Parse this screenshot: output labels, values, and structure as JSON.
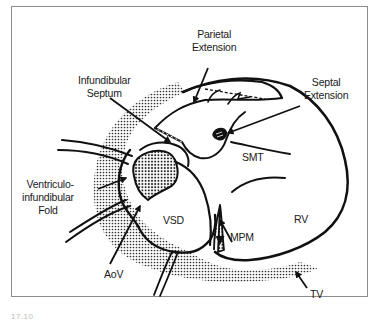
{
  "figure": {
    "caption": "17.10",
    "colors": {
      "line": "#111111",
      "stipple": "#333333",
      "frame": "#8c8c8c",
      "background": "#ffffff"
    }
  },
  "labels": {
    "parietal_extension": [
      "Parietal",
      "Extension"
    ],
    "infundibular_septum": [
      "Infundibular",
      "Septum"
    ],
    "septal_extension": [
      "Septal",
      "Extension"
    ],
    "smt": "SMT",
    "ventriculo_infundibular_fold": [
      "Ventriculo-",
      "infundibular",
      "Fold"
    ],
    "vsd": "VSD",
    "rv": "RV",
    "mpm": "MPM",
    "aov": "AoV",
    "tv": "TV"
  }
}
